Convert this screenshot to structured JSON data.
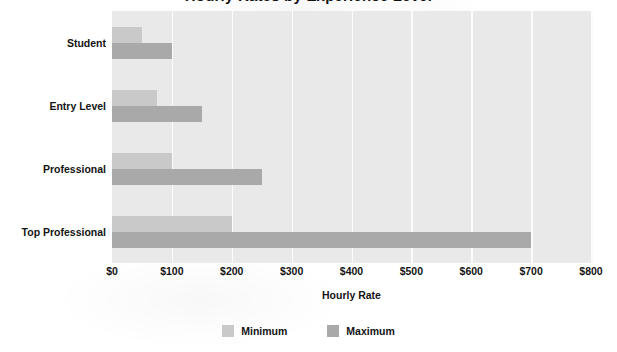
{
  "chart_data": {
    "type": "bar",
    "orientation": "horizontal",
    "title": "Hourly Rates by Experience Level",
    "subtitle": "",
    "xlabel": "Hourly Rate",
    "ylabel": "",
    "categories": [
      "Student",
      "Entry Level",
      "Professional",
      "Top Professional"
    ],
    "series": [
      {
        "name": "Minimum",
        "color": "#c9c9c9",
        "values": [
          50,
          75,
          100,
          200
        ]
      },
      {
        "name": "Maximum",
        "color": "#a9a9a9",
        "values": [
          100,
          150,
          250,
          700
        ]
      }
    ],
    "xlim": [
      0,
      800
    ],
    "xticks": [
      0,
      100,
      200,
      300,
      400,
      500,
      600,
      700,
      800
    ],
    "xticklabels": [
      "$0",
      "$100",
      "$200",
      "$300",
      "$400",
      "$500",
      "$600",
      "$700",
      "$800"
    ],
    "grid": "vertical",
    "legend_position": "bottom",
    "plot_background": "#e9e9e9",
    "gridline_color": "#fbfbfb",
    "value_prefix": "$"
  },
  "legend": {
    "items": [
      {
        "label": "Minimum",
        "color": "#c9c9c9"
      },
      {
        "label": "Maximum",
        "color": "#a9a9a9"
      }
    ]
  }
}
